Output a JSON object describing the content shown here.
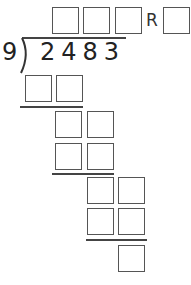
{
  "problem": {
    "divisor": "9",
    "dividend": "2483",
    "remainder_label": "R"
  },
  "answer_boxes": {
    "quotient_count": 3,
    "remainder_count": 1
  },
  "work_rows": [
    {
      "boxes": 2
    },
    {
      "boxes": 2
    },
    {
      "boxes": 2
    },
    {
      "boxes": 2
    },
    {
      "boxes": 2
    },
    {
      "boxes": 1
    }
  ],
  "colors": {
    "box_border": "#555555",
    "line": "#444444",
    "text": "#222222"
  }
}
